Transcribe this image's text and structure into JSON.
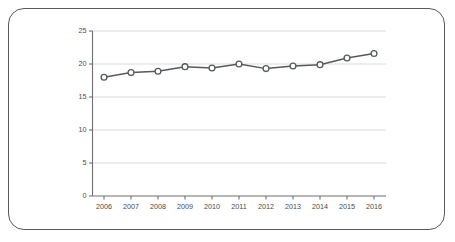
{
  "chart_data": {
    "type": "line",
    "title": "",
    "subtitle": "",
    "xlabel": "",
    "ylabel": "",
    "categories": [
      "2006",
      "2007",
      "2008",
      "2009",
      "2010",
      "2011",
      "2012",
      "2013",
      "2014",
      "2015",
      "2016"
    ],
    "values": [
      18.0,
      18.7,
      18.9,
      19.6,
      19.4,
      20.0,
      19.3,
      19.7,
      19.9,
      20.9,
      21.6
    ],
    "series": [
      {
        "name": "",
        "values": [
          18.0,
          18.7,
          18.9,
          19.6,
          19.4,
          20.0,
          19.3,
          19.7,
          19.9,
          20.9,
          21.6
        ]
      }
    ],
    "ylim": [
      0,
      25
    ],
    "yticks": [
      0,
      5,
      10,
      15,
      20,
      25
    ],
    "ytick_labels": [
      "0",
      "5",
      "10",
      "15",
      "20",
      "25"
    ],
    "xtick_labels": [
      "2006",
      "2007",
      "2008",
      "2009",
      "2010",
      "2011",
      "2012",
      "2013",
      "2014",
      "2015",
      "2016"
    ],
    "grid": true,
    "grid_axis": "y",
    "legend": false,
    "legend_position": "none",
    "annotations": [],
    "marker": "circle-open",
    "colors": {
      "line": "#55595c",
      "marker_fill": "#ffffff",
      "marker_stroke": "#55595c",
      "grid": "#d7d7d7",
      "axis": "#6f6f6f",
      "tick_label": "#4a4a4a",
      "frame_border": "#555a5e",
      "background": "#ffffff"
    }
  }
}
